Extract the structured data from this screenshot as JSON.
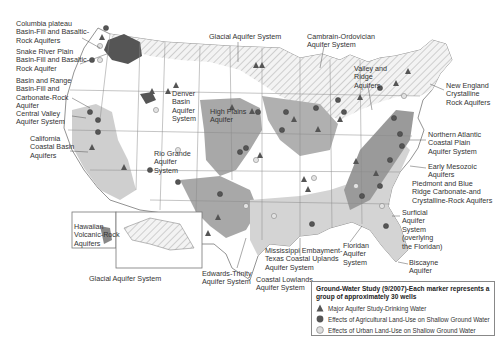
{
  "map": {
    "labels": [
      {
        "id": "columbia-plateau",
        "text": "Columbia plateau\nBasin-Fill and Basaltic-\nRock Aquifers",
        "x": 16,
        "y": 20
      },
      {
        "id": "snake-river",
        "text": "Snake River Plain\nBasin-Fill and Basaltic-\nRock Aquifer",
        "x": 16,
        "y": 48
      },
      {
        "id": "basin-range",
        "text": "Basin and Range\nBasin-Fill and\nCarbonate-Rock\nAquifer",
        "x": 16,
        "y": 77
      },
      {
        "id": "central-valley",
        "text": "Central Valley\nAquifer System",
        "x": 16,
        "y": 110
      },
      {
        "id": "california-coastal",
        "text": "California\nCoastal Basin\nAquifers",
        "x": 30,
        "y": 135
      },
      {
        "id": "hawaiian",
        "text": "Hawaiian\nVolcanic-Rock\nAquifers",
        "x": 74,
        "y": 223
      },
      {
        "id": "glacial-alaska",
        "text": "Glacial Aquifer System",
        "x": 89,
        "y": 275
      },
      {
        "id": "glacial-north",
        "text": "Glacial Aquifer System",
        "x": 209,
        "y": 33
      },
      {
        "id": "denver-basin",
        "text": "Denver\nBasin\nAquifer\nSystem",
        "x": 172,
        "y": 90
      },
      {
        "id": "high-plains",
        "text": "High Plains\nAquifer",
        "x": 210,
        "y": 108
      },
      {
        "id": "rio-grande",
        "text": "Rio Grande\nAquifer\nSystem",
        "x": 154,
        "y": 150
      },
      {
        "id": "edwards-trinity",
        "text": "Edwards-Trinity\nAquifer System",
        "x": 202,
        "y": 270
      },
      {
        "id": "coastal-lowlands",
        "text": "Coastal Lowlands\nAquifer System",
        "x": 256,
        "y": 276
      },
      {
        "id": "mississippi-embayment",
        "text": "Mississippi Embayment-\nTexas Coastal Uplands\nAquifer System",
        "x": 265,
        "y": 247
      },
      {
        "id": "floridan",
        "text": "Floridan\nAquifer\nSystem",
        "x": 343,
        "y": 242
      },
      {
        "id": "cambrian-ordovician",
        "text": "Cambrain-Ordovician\nAquifer System",
        "x": 307,
        "y": 33
      },
      {
        "id": "valley-ridge",
        "text": "Valley and\nRidge\nAquifers",
        "x": 354,
        "y": 65
      },
      {
        "id": "new-england",
        "text": "New England\nCrystalline\nRock Aquifers",
        "x": 446,
        "y": 82
      },
      {
        "id": "northern-atlantic",
        "text": "Northern Atlantic\nCoastal Plain\nAquifer System",
        "x": 428,
        "y": 131
      },
      {
        "id": "early-mesozoic",
        "text": "Early Mesozoic\nAquifers",
        "x": 428,
        "y": 163
      },
      {
        "id": "piedmont-blue-ridge",
        "text": "Piedmont and Blue\nRidge Carbonate-and\nCrystalline-Rock Aquifers",
        "x": 412,
        "y": 180
      },
      {
        "id": "surficial",
        "text": "Surficial\nAquifer\nSystem\n(overlying\nthe Floridan)",
        "x": 402,
        "y": 209
      },
      {
        "id": "biscayne",
        "text": "Biscayne\nAquifer",
        "x": 409,
        "y": 259
      }
    ]
  },
  "legend": {
    "title": "Ground-Water Study (9/2007)-Each marker represents a group of approximately 30 wells",
    "items": [
      {
        "symbol": "triangle",
        "label": "Major Aquifer Study-Drinking Water",
        "color": "#555555"
      },
      {
        "symbol": "dark-circle",
        "label": "Effects of Agricultural Land-Use on Shallow Ground Water",
        "color": "#555555"
      },
      {
        "symbol": "light-circle",
        "label": "Effects of Urban Land-Use on Shallow Ground Water",
        "color": "#d8d8d8"
      }
    ]
  },
  "colors": {
    "land": "#ffffff",
    "aquifer_shade": "#a8a8a8",
    "aquifer_light": "#d6d6d6",
    "dark_region": "#555555",
    "hatch": "#bdbdbd",
    "border": "#777777"
  }
}
